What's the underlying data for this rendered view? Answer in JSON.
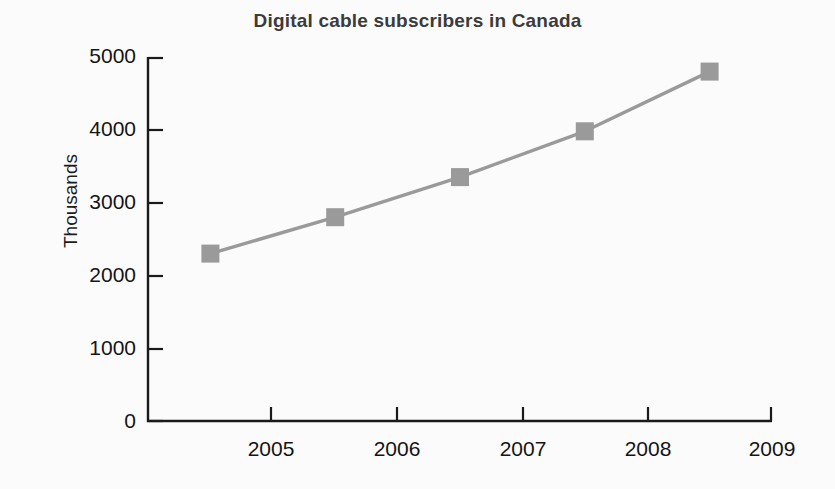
{
  "chart_data": {
    "type": "line",
    "title": "Digital cable subscribers in Canada",
    "xlabel": "",
    "ylabel": "Thousands",
    "x": [
      2004.5,
      2005.5,
      2006.5,
      2007.5,
      2008.5
    ],
    "values": [
      2300,
      2800,
      3350,
      3980,
      4800
    ],
    "series": [
      {
        "name": "Digital cable subscribers",
        "values": [
          2300,
          2800,
          3350,
          3980,
          4800
        ]
      }
    ],
    "xlim": [
      2004.0,
      2009.0
    ],
    "ylim": [
      0,
      5000
    ],
    "x_ticks": [
      2005,
      2006,
      2007,
      2008,
      2009
    ],
    "x_tick_labels": [
      "2005",
      "2006",
      "2007",
      "2008",
      "2009"
    ],
    "y_ticks": [
      0,
      1000,
      2000,
      3000,
      4000,
      5000
    ],
    "y_tick_labels": [
      "0",
      "1000",
      "2000",
      "3000",
      "4000",
      "5000"
    ],
    "grid": false,
    "legend": false,
    "marker": "square",
    "series_color": "#9a9a9a",
    "axis_color": "#1a1a1a",
    "title_color": "#3b3b3b",
    "background_color": "#fbfbfb"
  }
}
